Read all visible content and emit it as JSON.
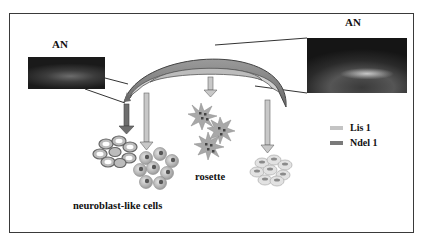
{
  "diagram": {
    "labels": {
      "an_left": "AN",
      "an_right": "AN",
      "neuroblast": "neuroblast-like cells",
      "rosette": "rosette"
    },
    "legend": [
      {
        "label": "Lis 1",
        "color": "#c4c4c4"
      },
      {
        "label": "Ndel 1",
        "color": "#7a7a7a"
      }
    ],
    "colors": {
      "frame": "#3a3a3a",
      "arc_outer": "#8c8c8c",
      "arc_inner": "#cfcfcf",
      "arrow_light": "#bdbdbd",
      "arrow_dark": "#6e6e6e",
      "cell_fill": "#c8c8c8",
      "nucleus": "#5a5a5a"
    },
    "nodes": [
      {
        "id": "an-tissue-arc",
        "type": "structure"
      },
      {
        "id": "an-micrograph-left",
        "type": "image"
      },
      {
        "id": "an-micrograph-right",
        "type": "image"
      },
      {
        "id": "cluster-1",
        "type": "cell-cluster"
      },
      {
        "id": "neuroblast-like-cells",
        "type": "cell-cluster"
      },
      {
        "id": "rosette",
        "type": "cell-cluster"
      },
      {
        "id": "cluster-4",
        "type": "cell-cluster"
      }
    ],
    "edges": [
      {
        "from": "an-tissue-arc",
        "to": "cluster-1",
        "style": "dark-arrow"
      },
      {
        "from": "an-tissue-arc",
        "to": "neuroblast-like-cells",
        "style": "light-arrow"
      },
      {
        "from": "an-tissue-arc",
        "to": "rosette",
        "style": "light-arrow"
      },
      {
        "from": "an-tissue-arc",
        "to": "cluster-4",
        "style": "light-arrow"
      },
      {
        "from": "an-micrograph-left",
        "to": "an-tissue-arc",
        "style": "zoom-lines"
      },
      {
        "from": "an-micrograph-right",
        "to": "an-tissue-arc",
        "style": "zoom-lines"
      }
    ]
  }
}
